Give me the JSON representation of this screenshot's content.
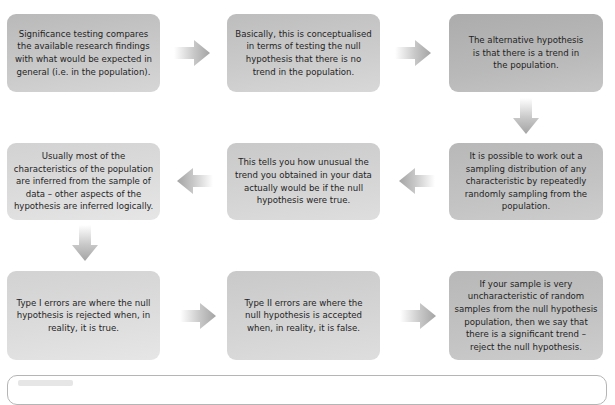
{
  "diagram": {
    "type": "flowchart",
    "steps": [
      {
        "id": 1,
        "text": "Significance testing compares the available research findings with what would be expected in general (i.e. in the population)."
      },
      {
        "id": 2,
        "text": "Basically, this is conceptualised in terms of testing the null hypothesis that there is no trend in the population."
      },
      {
        "id": 3,
        "text": "The alternative hypothesis is that there is a trend in the population."
      },
      {
        "id": 4,
        "text": "It is possible to work out a sampling distribution of any characteristic by repeatedly randomly sampling from the population."
      },
      {
        "id": 5,
        "text": "This tells you how unusual the trend you obtained in your data actually would be if the null hypothesis were true."
      },
      {
        "id": 6,
        "text": "Usually most of the characteristics of the population are inferred from the sample of data – other aspects of the hypothesis are inferred logically."
      },
      {
        "id": 7,
        "text": "Type I errors are where the null hypothesis is rejected when, in reality, it is true."
      },
      {
        "id": 8,
        "text": "Type II errors are where the null hypothesis is accepted when, in reality, it is false."
      },
      {
        "id": 9,
        "text": "If your sample is very uncharacteristic of random samples from the null hypothesis population, then we say that there is a significant trend – reject the null hypothesis."
      }
    ],
    "arrows": [
      {
        "from": 1,
        "to": 2,
        "direction": "right"
      },
      {
        "from": 2,
        "to": 3,
        "direction": "right"
      },
      {
        "from": 3,
        "to": 4,
        "direction": "down"
      },
      {
        "from": 4,
        "to": 5,
        "direction": "left"
      },
      {
        "from": 5,
        "to": 6,
        "direction": "left"
      },
      {
        "from": 6,
        "to": 7,
        "direction": "down"
      },
      {
        "from": 7,
        "to": 8,
        "direction": "right"
      },
      {
        "from": 8,
        "to": 9,
        "direction": "right"
      }
    ],
    "colors": {
      "box_fill": "#c4c4c4",
      "text": "#1f1f1f",
      "arrow": "#a8a8a8",
      "panel_border": "#b5b5b5"
    }
  }
}
